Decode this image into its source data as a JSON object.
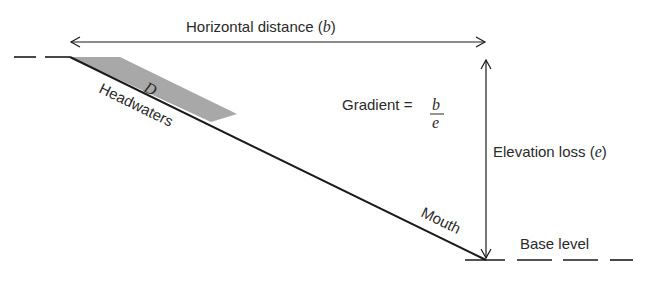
{
  "labels": {
    "horizontal": "Horizontal distance (",
    "horizontal_var": "b",
    "horizontal_close": ")",
    "gradient": "Gradient =",
    "gradient_num": "b",
    "gradient_den": "e",
    "elevation": "Elevation loss (",
    "elevation_var": "e",
    "elevation_close": ")",
    "headwaters": "Headwaters",
    "mouth": "Mouth",
    "base_level": "Base level",
    "shaded_region": "D"
  },
  "colors": {
    "line": "#1a1a1a",
    "shade": "#a8a8a8"
  }
}
